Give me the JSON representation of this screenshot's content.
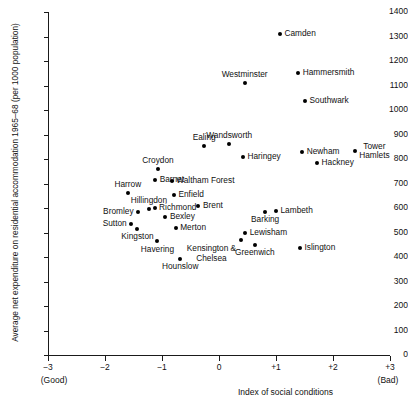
{
  "chart_data": {
    "type": "scatter",
    "title": "",
    "xlabel": "Index of social conditions",
    "ylabel": "Average net expenditure on residential accommodation 1965–68 (per 1000 population)",
    "x_low_note": "(Good)",
    "x_high_note": "(Bad)",
    "xlim": [
      -3,
      3
    ],
    "ylim": [
      0,
      1400
    ],
    "xticks": [
      "−3",
      "−2",
      "−1",
      "0",
      "+1",
      "+2",
      "+3"
    ],
    "xtick_values": [
      -3,
      -2,
      -1,
      0,
      1,
      2,
      3
    ],
    "yticks": [
      "0",
      "100",
      "200",
      "300",
      "400",
      "500",
      "600",
      "700",
      "800",
      "900",
      "1000",
      "1100",
      "1200",
      "1300",
      "1400"
    ],
    "ytick_values": [
      0,
      100,
      200,
      300,
      400,
      500,
      600,
      700,
      800,
      900,
      1000,
      1100,
      1200,
      1300,
      1400
    ],
    "grid": false,
    "legend": "none",
    "points": [
      {
        "name": "Camden",
        "x": 1.07,
        "y": 1310,
        "lpos": "right"
      },
      {
        "name": "Hammersmith",
        "x": 1.39,
        "y": 1150,
        "lpos": "right"
      },
      {
        "name": "Westminster",
        "x": 0.45,
        "y": 1110,
        "lpos": "above"
      },
      {
        "name": "Southwark",
        "x": 1.51,
        "y": 1035,
        "lpos": "right"
      },
      {
        "name": "Wandsworth",
        "x": 0.18,
        "y": 860,
        "lpos": "above"
      },
      {
        "name": "Ealing",
        "x": -0.26,
        "y": 852,
        "lpos": "above"
      },
      {
        "name": "Tower\nHamlets",
        "x": 2.38,
        "y": 832,
        "lpos": "right-two"
      },
      {
        "name": "Newham",
        "x": 1.46,
        "y": 830,
        "lpos": "right"
      },
      {
        "name": "Haringey",
        "x": 0.42,
        "y": 810,
        "lpos": "right"
      },
      {
        "name": "Hackney",
        "x": 1.72,
        "y": 785,
        "lpos": "right"
      },
      {
        "name": "Croydon",
        "x": -1.07,
        "y": 760,
        "lpos": "above"
      },
      {
        "name": "Barnet",
        "x": -1.12,
        "y": 715,
        "lpos": "right"
      },
      {
        "name": "Waltham Forest",
        "x": -0.83,
        "y": 712,
        "lpos": "right"
      },
      {
        "name": "Harrow",
        "x": -1.6,
        "y": 662,
        "lpos": "above"
      },
      {
        "name": "Enfield",
        "x": -0.79,
        "y": 652,
        "lpos": "right"
      },
      {
        "name": "Brent",
        "x": -0.36,
        "y": 610,
        "lpos": "right"
      },
      {
        "name": "Hillingdon",
        "x": -1.23,
        "y": 595,
        "lpos": "above"
      },
      {
        "name": "Richmond",
        "x": -1.13,
        "y": 598,
        "lpos": "right"
      },
      {
        "name": "Bromley",
        "x": -1.42,
        "y": 582,
        "lpos": "left"
      },
      {
        "name": "Bexley",
        "x": -0.94,
        "y": 565,
        "lpos": "right"
      },
      {
        "name": "Lambeth",
        "x": 1.0,
        "y": 588,
        "lpos": "right"
      },
      {
        "name": "Barking",
        "x": 0.81,
        "y": 585,
        "lpos": "below"
      },
      {
        "name": "Sutton",
        "x": -1.54,
        "y": 535,
        "lpos": "left"
      },
      {
        "name": "Kingston",
        "x": -1.43,
        "y": 515,
        "lpos": "below"
      },
      {
        "name": "Merton",
        "x": -0.76,
        "y": 520,
        "lpos": "right"
      },
      {
        "name": "Lewisham",
        "x": 0.46,
        "y": 498,
        "lpos": "right"
      },
      {
        "name": "Kensington &\nChelsea",
        "x": 0.38,
        "y": 470,
        "lpos": "below-two"
      },
      {
        "name": "Havering",
        "x": -1.08,
        "y": 465,
        "lpos": "below"
      },
      {
        "name": "Greenwich",
        "x": 0.63,
        "y": 450,
        "lpos": "below"
      },
      {
        "name": "Islington",
        "x": 1.42,
        "y": 435,
        "lpos": "right"
      },
      {
        "name": "Hounslow",
        "x": -0.68,
        "y": 393,
        "lpos": "below"
      }
    ]
  }
}
